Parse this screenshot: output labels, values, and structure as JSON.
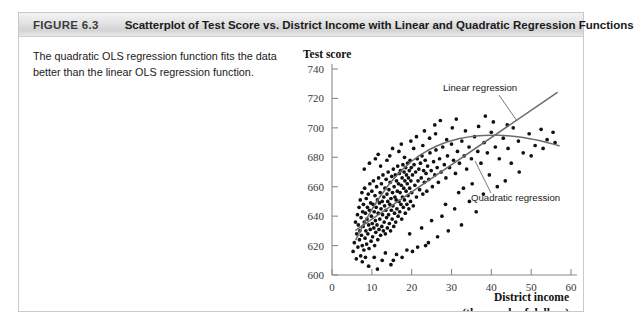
{
  "figure": {
    "number": "FIGURE 6.3",
    "title": "Scatterplot of Test Score vs. District Income with Linear and Quadratic Regression Functions",
    "caption": "The quadratic OLS regression function fits the data better than the linear OLS regression function."
  },
  "chart_data": {
    "type": "scatter",
    "title": "",
    "ylabel": "Test score",
    "xlabel": "District income",
    "xlabel_sub": "(thousands of dollars)",
    "xlim": [
      0,
      60
    ],
    "ylim": [
      600,
      740
    ],
    "xticks": [
      "0",
      "10",
      "20",
      "30",
      "40",
      "50",
      "60"
    ],
    "yticks": [
      "600",
      "620",
      "640",
      "660",
      "680",
      "700",
      "720",
      "740"
    ],
    "grid": false,
    "legend_position": "inline-annotations",
    "annotations": [
      {
        "name": "linear-regression-label",
        "text": "Linear regression"
      },
      {
        "name": "quadratic-regression-label",
        "text": "Quadratic regression"
      }
    ],
    "series": [
      {
        "name": "Districts",
        "type": "scatter",
        "marker": "filled-circle",
        "color": "#111111",
        "points": [
          [
            5.3,
            616
          ],
          [
            5.6,
            622
          ],
          [
            5.9,
            636
          ],
          [
            6.1,
            611
          ],
          [
            6.2,
            628
          ],
          [
            6.4,
            641
          ],
          [
            6.5,
            619
          ],
          [
            6.6,
            634
          ],
          [
            6.8,
            646
          ],
          [
            6.9,
            624
          ],
          [
            7.0,
            630
          ],
          [
            7.1,
            651
          ],
          [
            7.2,
            613
          ],
          [
            7.3,
            639
          ],
          [
            7.4,
            627
          ],
          [
            7.5,
            656
          ],
          [
            7.6,
            620
          ],
          [
            7.7,
            643
          ],
          [
            7.8,
            633
          ],
          [
            7.9,
            648
          ],
          [
            8.0,
            617
          ],
          [
            8.1,
            636
          ],
          [
            8.2,
            659
          ],
          [
            8.3,
            625
          ],
          [
            8.4,
            642
          ],
          [
            8.5,
            630
          ],
          [
            8.6,
            652
          ],
          [
            8.7,
            621
          ],
          [
            8.8,
            638
          ],
          [
            8.9,
            646
          ],
          [
            9.0,
            628
          ],
          [
            9.1,
            655
          ],
          [
            9.2,
            634
          ],
          [
            9.3,
            618
          ],
          [
            9.4,
            644
          ],
          [
            9.5,
            662
          ],
          [
            9.6,
            631
          ],
          [
            9.7,
            649
          ],
          [
            9.8,
            623
          ],
          [
            9.9,
            640
          ],
          [
            10.0,
            657
          ],
          [
            10.1,
            635
          ],
          [
            10.2,
            626
          ],
          [
            10.3,
            648
          ],
          [
            10.4,
            664
          ],
          [
            10.5,
            632
          ],
          [
            10.6,
            643
          ],
          [
            10.7,
            620
          ],
          [
            10.8,
            654
          ],
          [
            10.9,
            637
          ],
          [
            11.0,
            629
          ],
          [
            11.1,
            646
          ],
          [
            11.2,
            660
          ],
          [
            11.3,
            634
          ],
          [
            11.4,
            651
          ],
          [
            11.5,
            624
          ],
          [
            11.6,
            642
          ],
          [
            11.7,
            666
          ],
          [
            11.8,
            631
          ],
          [
            11.9,
            649
          ],
          [
            12.0,
            638
          ],
          [
            12.1,
            656
          ],
          [
            12.2,
            627
          ],
          [
            12.3,
            645
          ],
          [
            12.4,
            662
          ],
          [
            12.5,
            633
          ],
          [
            12.6,
            650
          ],
          [
            12.7,
            641
          ],
          [
            12.8,
            668
          ],
          [
            12.9,
            630
          ],
          [
            13.0,
            653
          ],
          [
            13.1,
            636
          ],
          [
            13.2,
            647
          ],
          [
            13.3,
            659
          ],
          [
            13.4,
            628
          ],
          [
            13.5,
            644
          ],
          [
            13.6,
            665
          ],
          [
            13.7,
            639
          ],
          [
            13.8,
            655
          ],
          [
            13.9,
            632
          ],
          [
            14.0,
            650
          ],
          [
            14.1,
            670
          ],
          [
            14.2,
            641
          ],
          [
            14.3,
            658
          ],
          [
            14.4,
            635
          ],
          [
            14.5,
            648
          ],
          [
            14.6,
            663
          ],
          [
            14.7,
            630
          ],
          [
            14.8,
            652
          ],
          [
            14.9,
            644
          ],
          [
            15.0,
            667
          ],
          [
            15.1,
            638
          ],
          [
            15.2,
            656
          ],
          [
            15.3,
            647
          ],
          [
            15.4,
            672
          ],
          [
            15.5,
            633
          ],
          [
            15.6,
            660
          ],
          [
            15.7,
            642
          ],
          [
            15.8,
            653
          ],
          [
            15.9,
            668
          ],
          [
            16.0,
            636
          ],
          [
            16.1,
            651
          ],
          [
            16.2,
            664
          ],
          [
            16.3,
            645
          ],
          [
            16.4,
            657
          ],
          [
            16.5,
            674
          ],
          [
            16.6,
            640
          ],
          [
            16.7,
            662
          ],
          [
            16.8,
            650
          ],
          [
            16.9,
            669
          ],
          [
            17.0,
            643
          ],
          [
            17.1,
            656
          ],
          [
            17.2,
            671
          ],
          [
            17.3,
            648
          ],
          [
            17.4,
            661
          ],
          [
            17.5,
            638
          ],
          [
            17.6,
            666
          ],
          [
            17.7,
            653
          ],
          [
            17.8,
            675
          ],
          [
            17.9,
            646
          ],
          [
            18.0,
            659
          ],
          [
            18.1,
            670
          ],
          [
            18.2,
            651
          ],
          [
            18.3,
            664
          ],
          [
            18.4,
            642
          ],
          [
            18.5,
            673
          ],
          [
            18.6,
            657
          ],
          [
            18.7,
            668
          ],
          [
            18.8,
            648
          ],
          [
            18.9,
            662
          ],
          [
            19.0,
            676
          ],
          [
            19.1,
            654
          ],
          [
            19.2,
            666
          ],
          [
            19.3,
            645
          ],
          [
            19.4,
            671
          ],
          [
            19.5,
            659
          ],
          [
            19.6,
            678
          ],
          [
            19.7,
            650
          ],
          [
            19.8,
            664
          ],
          [
            19.9,
            673
          ],
          [
            20.0,
            656
          ],
          [
            20.2,
            668
          ],
          [
            20.4,
            647
          ],
          [
            20.6,
            675
          ],
          [
            20.8,
            661
          ],
          [
            21.0,
            670
          ],
          [
            21.2,
            653
          ],
          [
            21.4,
            679
          ],
          [
            21.6,
            664
          ],
          [
            21.8,
            672
          ],
          [
            22.0,
            658
          ],
          [
            22.2,
            676
          ],
          [
            22.4,
            666
          ],
          [
            22.6,
            681
          ],
          [
            22.8,
            655
          ],
          [
            23.0,
            671
          ],
          [
            23.2,
            663
          ],
          [
            23.4,
            678
          ],
          [
            23.6,
            669
          ],
          [
            23.8,
            657
          ],
          [
            24.0,
            674
          ],
          [
            24.3,
            665
          ],
          [
            24.6,
            683
          ],
          [
            24.9,
            671
          ],
          [
            25.2,
            660
          ],
          [
            25.5,
            677
          ],
          [
            25.8,
            668
          ],
          [
            26.1,
            685
          ],
          [
            26.4,
            673
          ],
          [
            26.7,
            663
          ],
          [
            27.0,
            679
          ],
          [
            27.4,
            670
          ],
          [
            27.8,
            687
          ],
          [
            28.2,
            675
          ],
          [
            28.6,
            666
          ],
          [
            29.0,
            681
          ],
          [
            29.5,
            673
          ],
          [
            30.0,
            689
          ],
          [
            30.5,
            678
          ],
          [
            31.0,
            669
          ],
          [
            31.5,
            684
          ],
          [
            32.0,
            676
          ],
          [
            32.6,
            691
          ],
          [
            33.2,
            681
          ],
          [
            33.8,
            672
          ],
          [
            34.4,
            687
          ],
          [
            35.0,
            679
          ],
          [
            35.8,
            694
          ],
          [
            36.6,
            684
          ],
          [
            37.4,
            676
          ],
          [
            38.2,
            690
          ],
          [
            39.0,
            683
          ],
          [
            40.0,
            697
          ],
          [
            41.0,
            687
          ],
          [
            42.0,
            679
          ],
          [
            43.0,
            693
          ],
          [
            44.2,
            686
          ],
          [
            45.5,
            700
          ],
          [
            46.8,
            691
          ],
          [
            48.0,
            683
          ],
          [
            49.5,
            696
          ],
          [
            51.0,
            688
          ],
          [
            52.5,
            699
          ],
          [
            54.0,
            692
          ],
          [
            55.5,
            697
          ],
          [
            9.2,
            606
          ],
          [
            11.4,
            604
          ],
          [
            14.8,
            607
          ],
          [
            7.6,
            609
          ],
          [
            12.6,
            610
          ],
          [
            10.6,
            612
          ],
          [
            8.4,
            612
          ],
          [
            13.4,
            615
          ],
          [
            16.2,
            614
          ],
          [
            18.8,
            617
          ],
          [
            21.5,
            619
          ],
          [
            24.2,
            622
          ],
          [
            15.4,
            610
          ],
          [
            17.6,
            612
          ],
          [
            20.2,
            616
          ],
          [
            23.5,
            620
          ],
          [
            26.5,
            626
          ],
          [
            29.2,
            630
          ],
          [
            32.5,
            634
          ],
          [
            27.6,
            640
          ],
          [
            30.8,
            645
          ],
          [
            34.5,
            650
          ],
          [
            38.0,
            655
          ],
          [
            41.5,
            660
          ],
          [
            36.2,
            643
          ],
          [
            43.5,
            664
          ],
          [
            47.0,
            670
          ],
          [
            25.0,
            637
          ],
          [
            22.5,
            632
          ],
          [
            19.5,
            628
          ],
          [
            28.5,
            648
          ],
          [
            31.8,
            656
          ],
          [
            35.2,
            662
          ],
          [
            39.5,
            668
          ],
          [
            33.0,
            659
          ],
          [
            45.0,
            676
          ],
          [
            50.0,
            681
          ],
          [
            53.0,
            686
          ],
          [
            56.0,
            690
          ],
          [
            8.1,
            672
          ],
          [
            9.4,
            676
          ],
          [
            10.9,
            679
          ],
          [
            12.2,
            674
          ],
          [
            13.8,
            678
          ],
          [
            11.6,
            682
          ],
          [
            14.5,
            681
          ],
          [
            16.8,
            684
          ],
          [
            18.2,
            680
          ],
          [
            20.5,
            686
          ],
          [
            15.2,
            686
          ],
          [
            17.4,
            689
          ],
          [
            19.8,
            691
          ],
          [
            22.8,
            688
          ],
          [
            24.5,
            693
          ],
          [
            21.2,
            694
          ],
          [
            26.0,
            696
          ],
          [
            28.8,
            692
          ],
          [
            23.2,
            698
          ],
          [
            30.2,
            700
          ],
          [
            25.8,
            702
          ],
          [
            33.5,
            698
          ],
          [
            36.8,
            701
          ],
          [
            40.5,
            704
          ],
          [
            44.0,
            702
          ],
          [
            27.2,
            705
          ],
          [
            31.2,
            706
          ],
          [
            38.5,
            708
          ]
        ]
      },
      {
        "name": "Linear regression",
        "type": "line",
        "color": "#6b6b6b",
        "points": [
          [
            6.0,
            630.5
          ],
          [
            56.5,
            724.0
          ]
        ]
      },
      {
        "name": "Quadratic regression",
        "type": "line",
        "color": "#6b6b6b",
        "points": [
          [
            6.0,
            624.0
          ],
          [
            8.0,
            635.0
          ],
          [
            10.0,
            644.5
          ],
          [
            12.0,
            653.0
          ],
          [
            14.0,
            660.5
          ],
          [
            16.0,
            667.0
          ],
          [
            18.0,
            672.5
          ],
          [
            20.0,
            677.3
          ],
          [
            22.0,
            681.3
          ],
          [
            24.0,
            684.6
          ],
          [
            26.0,
            687.3
          ],
          [
            28.0,
            689.5
          ],
          [
            30.0,
            691.3
          ],
          [
            32.0,
            692.7
          ],
          [
            34.0,
            693.7
          ],
          [
            36.0,
            694.4
          ],
          [
            38.0,
            694.8
          ],
          [
            40.0,
            695.0
          ],
          [
            42.0,
            694.9
          ],
          [
            44.0,
            694.6
          ],
          [
            46.0,
            694.1
          ],
          [
            48.0,
            693.4
          ],
          [
            50.0,
            692.5
          ],
          [
            52.0,
            691.4
          ],
          [
            54.0,
            690.1
          ],
          [
            56.0,
            688.6
          ],
          [
            57.0,
            687.8
          ]
        ]
      }
    ]
  }
}
